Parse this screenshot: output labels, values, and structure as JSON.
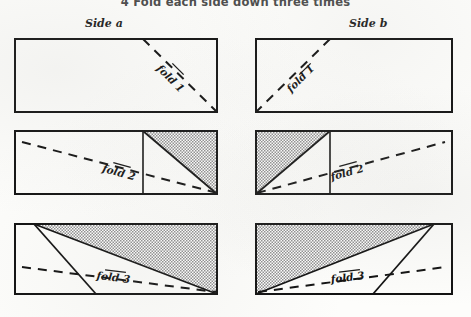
{
  "figure": {
    "title": "4 Fold each side down three times",
    "step_number": "4",
    "columns": [
      {
        "id": "side-a",
        "label": "Side a"
      },
      {
        "id": "side-b",
        "label": "Side b"
      }
    ],
    "rows": [
      {
        "row_number": 1,
        "fold_label": "fold 1",
        "panels": [
          {
            "column": "side-a",
            "fold_label": "fold 1",
            "shaded": false,
            "divider": false
          },
          {
            "column": "side-b",
            "fold_label": "fold 1",
            "shaded": false,
            "divider": false
          }
        ]
      },
      {
        "row_number": 2,
        "fold_label": "fold 2",
        "panels": [
          {
            "column": "side-a",
            "fold_label": "fold 2",
            "shaded": true,
            "divider": true
          },
          {
            "column": "side-b",
            "fold_label": "fold 2",
            "shaded": true,
            "divider": true
          }
        ]
      },
      {
        "row_number": 3,
        "fold_label": "fold 3",
        "panels": [
          {
            "column": "side-a",
            "fold_label": "fold 3",
            "shaded": true,
            "divider": false
          },
          {
            "column": "side-b",
            "fold_label": "fold 3",
            "shaded": true,
            "divider": false
          }
        ]
      }
    ]
  },
  "colors": {
    "ink": "#101010",
    "paper": "#fdfdfb",
    "shading": "#b4b4b4",
    "title_gray": "#4a4a4a"
  }
}
